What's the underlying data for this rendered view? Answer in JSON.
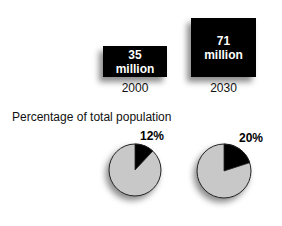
{
  "chart_data": [
    {
      "type": "bar",
      "title": "",
      "categories": [
        "2000",
        "2030"
      ],
      "values": [
        35,
        71
      ],
      "value_labels": [
        "35\nmillion",
        "71\nmillion"
      ],
      "unit": "million",
      "note": "Rendered as black squares scaled by value"
    },
    {
      "type": "pie",
      "title": "Percentage of total population",
      "pies": [
        {
          "category": "2000",
          "slices": [
            {
              "label": "12%",
              "value": 12
            },
            {
              "label": "",
              "value": 88
            }
          ]
        },
        {
          "category": "2030",
          "slices": [
            {
              "label": "20%",
              "value": 20
            },
            {
              "label": "",
              "value": 80
            }
          ]
        }
      ]
    }
  ],
  "boxes": [
    {
      "value": "35",
      "unit": "million",
      "year": "2000"
    },
    {
      "value": "71",
      "unit": "million",
      "year": "2030"
    }
  ],
  "pie_section": {
    "title": "Percentage of total population",
    "pies": [
      {
        "label": "12%",
        "percent": 12
      },
      {
        "label": "20%",
        "percent": 20
      }
    ]
  },
  "colors": {
    "highlight": "#000000",
    "rest": "#c8c8c8",
    "outline": "#222222"
  }
}
